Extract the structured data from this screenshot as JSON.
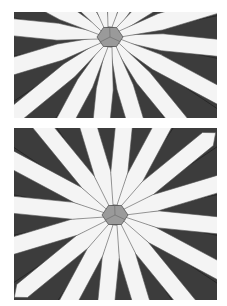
{
  "illustration": {
    "subject": "daisy quilt block",
    "colors": {
      "background": "#3c3c3c",
      "petal": "#f4f4f4",
      "center": "#9a9a9a",
      "seam": "#2a2a2a"
    },
    "panels": [
      {
        "name": "top-panel",
        "center": [
          96,
          25
        ],
        "petals": 16,
        "petal_length": 150,
        "petal_width": 17
      },
      {
        "name": "bottom-panel",
        "center": [
          101,
          87
        ],
        "petals": 16,
        "petal_length": 120,
        "petal_width": 17
      }
    ]
  }
}
